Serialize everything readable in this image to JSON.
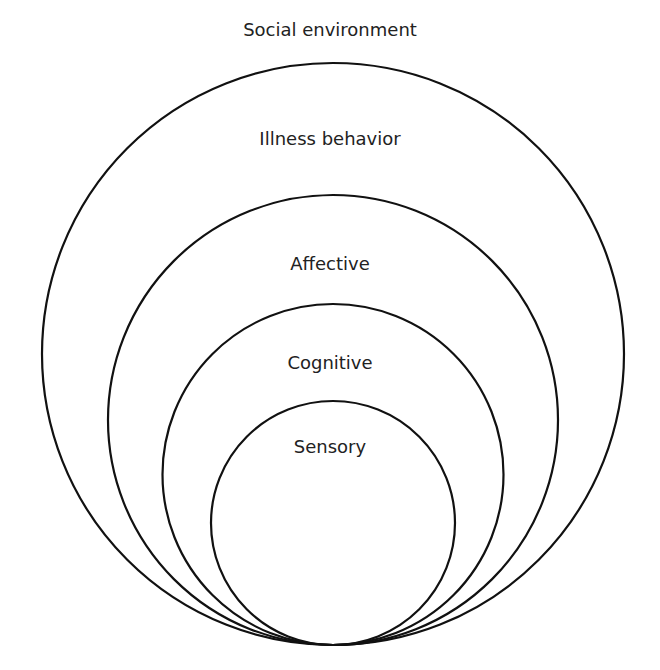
{
  "diagram": {
    "type": "nested-circles",
    "stroke_color": "#111111",
    "text_color": "#222222",
    "layers": [
      {
        "label": "Social environment",
        "position": "outside"
      },
      {
        "label": "Illness behavior",
        "cx": 333,
        "cy": 354,
        "r": 291
      },
      {
        "label": "Affective",
        "cx": 333,
        "cy": 420,
        "r": 225
      },
      {
        "label": "Cognitive",
        "cx": 333,
        "cy": 474.5,
        "r": 170.5
      },
      {
        "label": "Sensory",
        "cx": 333,
        "cy": 523,
        "r": 122
      }
    ]
  }
}
